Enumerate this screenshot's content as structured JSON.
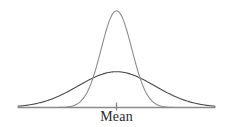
{
  "figure": {
    "background_color": "#ffffff",
    "axis_label": "Mean",
    "axis_label_color": "#2b2b2b",
    "baseline_color": "#8a8a8a",
    "tick_color": "#8a8a8a"
  },
  "chart_data": {
    "type": "line",
    "title": "",
    "subtitle": "",
    "xlabel": "Mean",
    "ylabel": "",
    "grid": false,
    "legend": null,
    "annotations": [
      {
        "name": "mean-tick",
        "text": "Mean",
        "x": 0,
        "y": 0,
        "description": "center tick mark on the horizontal baseline marking the common mean of both curves"
      }
    ],
    "axis": {
      "x_range": [
        -4,
        4
      ],
      "y_range": [
        0,
        1.06
      ],
      "x_ticks": [
        0
      ],
      "x_tick_labels": [
        "Mean"
      ],
      "y_ticks": [],
      "y_tick_labels": [],
      "baseline_y": 0
    },
    "series": [
      {
        "name": "narrow-distribution",
        "label": "tall narrow normal curve (small standard deviation)",
        "color": "#8d8d8d",
        "line_width": 1.1,
        "mean": 0,
        "std_dev": 0.62,
        "peak_value": 1.0,
        "x": [
          -4,
          -3.5,
          -3,
          -2.5,
          -2,
          -1.75,
          -1.5,
          -1.25,
          -1,
          -0.75,
          -0.5,
          -0.25,
          0,
          0.25,
          0.5,
          0.75,
          1,
          1.25,
          1.5,
          1.75,
          2,
          2.5,
          3,
          3.5,
          4
        ],
        "values": [
          0.0,
          0.0005,
          0.0026,
          0.0121,
          0.0461,
          0.0848,
          0.1457,
          0.2338,
          0.3509,
          0.4923,
          0.6442,
          0.7878,
          0.9036,
          0.9767,
          1.0,
          0.9767,
          0.9036,
          0.7878,
          0.6442,
          0.4923,
          0.3509,
          0.1457,
          0.0461,
          0.0121,
          0.0026
        ]
      },
      {
        "name": "wide-distribution",
        "label": "low flat normal curve (large standard deviation)",
        "color": "#4a4a4a",
        "line_width": 1.1,
        "mean": 0,
        "std_dev": 1.55,
        "peak_value": 0.37,
        "x": [
          -4,
          -3.5,
          -3,
          -2.5,
          -2,
          -1.75,
          -1.5,
          -1.25,
          -1,
          -0.75,
          -0.5,
          -0.25,
          0,
          0.25,
          0.5,
          0.75,
          1,
          1.25,
          1.5,
          1.75,
          2,
          2.5,
          3,
          3.5,
          4
        ],
        "values": [
          0.0,
          0.0141,
          0.0302,
          0.0574,
          0.0972,
          0.1216,
          0.1486,
          0.1771,
          0.2057,
          0.2328,
          0.2568,
          0.2762,
          0.2896,
          0.2762,
          0.2568,
          0.2328,
          0.2057,
          0.1771,
          0.1486,
          0.1216,
          0.0972,
          0.0574,
          0.0302,
          0.0141,
          0.0
        ]
      }
    ]
  }
}
